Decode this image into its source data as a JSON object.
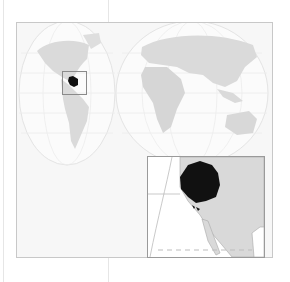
{
  "map": {
    "type": "locator-map",
    "projection": "interrupted-two-lobe-world",
    "highlight_color": "#111111",
    "land_color": "#d9d9d9",
    "ocean_color": "#ffffff",
    "graticule_color": "#e2e2e2",
    "frame_color": "#c8c8c8",
    "locator_box": {
      "region": "western-north-america"
    },
    "inset": {
      "region": "pacific-northwest-great-basin",
      "features": [
        "highlighted-region",
        "california-coast",
        "baja-california",
        "dashed-border-line"
      ]
    }
  }
}
